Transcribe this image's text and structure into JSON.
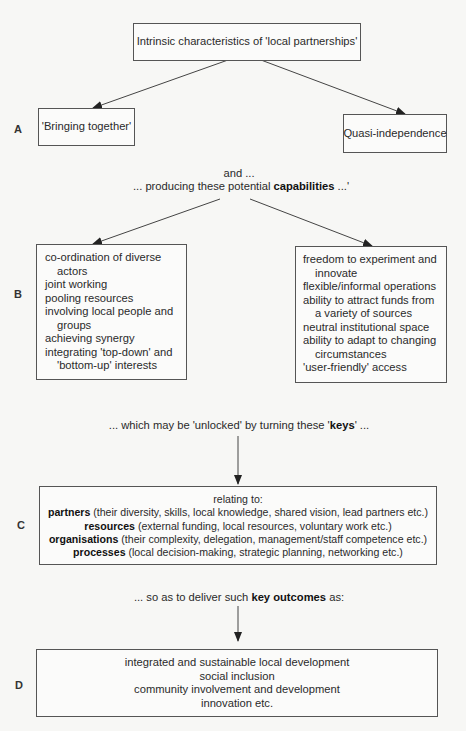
{
  "top_box": {
    "text": "Intrinsic characteristics of 'local partnerships'"
  },
  "section_a": {
    "label": "A",
    "left_box": "'Bringing together'",
    "right_box": "Quasi-independence"
  },
  "connector_ab": {
    "line1": "and ...",
    "line2_prefix": "... producing these potential ",
    "line2_bold": "capabilities",
    "line2_suffix": " ...'"
  },
  "section_b": {
    "label": "B",
    "left_items": [
      "co-ordination of diverse actors",
      "joint working",
      "pooling resources",
      "involving local people and groups",
      "achieving synergy",
      "integrating 'top-down' and 'bottom-up' interests"
    ],
    "right_items": [
      "freedom to experiment and innovate",
      "flexible/informal operations",
      "ability to attract funds from a variety of sources",
      "neutral institutional space",
      "ability to adapt to changing circumstances",
      "'user-friendly' access"
    ]
  },
  "connector_bc": {
    "prefix": "... which may be 'unlocked' by turning these '",
    "bold": "keys",
    "suffix": "' ..."
  },
  "section_c": {
    "label": "C",
    "heading": "relating to:",
    "rows": [
      {
        "key": "partners",
        "detail": " (their diversity, skills, local knowledge, shared vision, lead partners etc.)"
      },
      {
        "key": "resources",
        "detail": " (external funding, local resources, voluntary work etc.)"
      },
      {
        "key": "organisations",
        "detail": " (their complexity, delegation, management/staff competence etc.)"
      },
      {
        "key": "processes",
        "detail": " (local decision-making, strategic planning, networking etc.)"
      }
    ]
  },
  "connector_cd": {
    "prefix": "... so as to deliver such ",
    "bold": "key outcomes",
    "suffix": " as:"
  },
  "section_d": {
    "label": "D",
    "items": [
      "integrated and sustainable local development",
      "social inclusion",
      "community involvement and development",
      "innovation etc."
    ]
  },
  "colors": {
    "line": "#444444",
    "border": "#555555",
    "background": "#f7f7f5"
  }
}
